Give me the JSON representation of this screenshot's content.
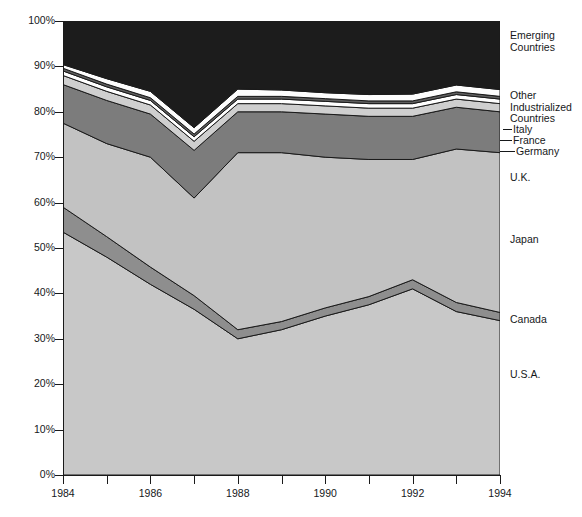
{
  "chart_data": {
    "type": "area",
    "stacked": true,
    "title": "",
    "subtitle": "",
    "xlabel": "",
    "ylabel": "",
    "xlim": [
      1984,
      1994
    ],
    "ylim": [
      0,
      100
    ],
    "grid": false,
    "legend_position": "right",
    "x": [
      1984,
      1985,
      1986,
      1987,
      1988,
      1989,
      1990,
      1991,
      1992,
      1993,
      1994
    ],
    "y_ticks": [
      "0%",
      "10%",
      "20%",
      "30%",
      "40%",
      "50%",
      "60%",
      "70%",
      "80%",
      "90%",
      "100%"
    ],
    "y_tick_values": [
      0,
      10,
      20,
      30,
      40,
      50,
      60,
      70,
      80,
      90,
      100
    ],
    "x_ticks": [
      "1984",
      "",
      "1986",
      "",
      "1988",
      "",
      "1990",
      "",
      "1992",
      "",
      "1994"
    ],
    "x_tick_values": [
      1984,
      1985,
      1986,
      1987,
      1988,
      1989,
      1990,
      1991,
      1992,
      1993,
      1994
    ],
    "series": [
      {
        "name": "U.S.A.",
        "color": "#c8c8c8",
        "values": [
          53.5,
          48.0,
          42.0,
          36.5,
          30.0,
          32.0,
          35.0,
          37.5,
          41.0,
          36.0,
          34.0
        ]
      },
      {
        "name": "Canada",
        "color": "#8e8e8e",
        "values": [
          5.5,
          4.5,
          3.8,
          3.0,
          2.0,
          1.8,
          1.8,
          1.8,
          2.0,
          2.0,
          1.8
        ]
      },
      {
        "name": "Japan",
        "color": "#c2c2c2",
        "values": [
          18.5,
          20.5,
          24.2,
          21.5,
          39.0,
          37.2,
          33.2,
          30.2,
          26.5,
          33.8,
          35.2
        ]
      },
      {
        "name": "U.K.",
        "color": "#7c7c7c",
        "values": [
          8.5,
          9.5,
          9.5,
          10.5,
          9.0,
          9.0,
          9.5,
          9.5,
          9.5,
          9.2,
          9.0
        ]
      },
      {
        "name": "Germany",
        "color": "#cfcfcf",
        "values": [
          2.0,
          2.0,
          2.0,
          2.0,
          1.8,
          1.8,
          1.8,
          1.8,
          1.8,
          1.8,
          1.8
        ]
      },
      {
        "name": "France",
        "color": "#ffffff",
        "values": [
          1.0,
          1.0,
          1.0,
          1.0,
          1.0,
          1.0,
          1.0,
          1.0,
          1.0,
          1.0,
          1.0
        ]
      },
      {
        "name": "Italy",
        "color": "#5e5e5e",
        "values": [
          0.6,
          0.6,
          0.6,
          0.6,
          0.6,
          0.6,
          0.6,
          0.6,
          0.6,
          0.6,
          0.6
        ]
      },
      {
        "name": "Other Industrialized Countries",
        "color": "#fdfdfd",
        "values": [
          0.8,
          1.2,
          1.4,
          1.4,
          1.6,
          1.4,
          1.3,
          1.4,
          1.5,
          1.5,
          1.5
        ]
      },
      {
        "name": "Emerging Countries",
        "color": "#1c1c1c",
        "values": [
          9.6,
          12.7,
          15.5,
          23.5,
          15.0,
          15.2,
          15.8,
          16.2,
          16.1,
          14.1,
          15.1
        ]
      }
    ],
    "cumulative_tops": {
      "usa": [
        53.5,
        48.0,
        42.0,
        36.5,
        30.0,
        32.0,
        35.0,
        37.5,
        41.0,
        36.0,
        34.0
      ],
      "canada": [
        59.0,
        52.5,
        45.8,
        39.5,
        32.0,
        33.8,
        36.8,
        39.3,
        43.0,
        38.0,
        35.8
      ],
      "japan": [
        77.5,
        73.0,
        70.0,
        61.0,
        71.0,
        71.0,
        70.0,
        69.5,
        69.5,
        71.8,
        71.0
      ],
      "uk": [
        86.0,
        82.5,
        79.5,
        71.5,
        80.0,
        80.0,
        79.5,
        79.0,
        79.0,
        81.0,
        80.0
      ],
      "germany": [
        88.0,
        84.5,
        81.5,
        73.5,
        81.8,
        81.8,
        81.3,
        80.8,
        80.8,
        82.8,
        81.8
      ],
      "france": [
        89.0,
        85.5,
        82.5,
        74.5,
        82.8,
        82.8,
        82.3,
        81.8,
        81.8,
        83.8,
        82.8
      ],
      "italy": [
        89.6,
        86.1,
        83.1,
        75.1,
        83.4,
        83.4,
        82.9,
        82.4,
        82.4,
        84.4,
        83.4
      ],
      "other_ind": [
        90.4,
        87.3,
        84.5,
        76.5,
        85.0,
        84.8,
        84.2,
        83.8,
        83.9,
        85.9,
        84.9
      ],
      "emerging": [
        100.0,
        100.0,
        100.0,
        100.0,
        100.0,
        100.0,
        100.0,
        100.0,
        100.0,
        100.0,
        100.0
      ]
    }
  },
  "legend": {
    "items": [
      {
        "id": "emerging-countries",
        "label": "Emerging\nCountries"
      },
      {
        "id": "other-industrialized",
        "label": "Other\nIndustrialized\nCountries"
      },
      {
        "id": "italy",
        "label": "Italy"
      },
      {
        "id": "france",
        "label": "France"
      },
      {
        "id": "germany",
        "label": "Germany"
      },
      {
        "id": "uk",
        "label": "U.K."
      },
      {
        "id": "japan",
        "label": "Japan"
      },
      {
        "id": "canada",
        "label": "Canada"
      },
      {
        "id": "usa",
        "label": "U.S.A."
      }
    ]
  },
  "caption": ""
}
